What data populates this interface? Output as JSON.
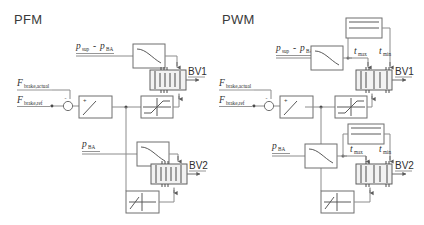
{
  "figure": {
    "background": "#ffffff",
    "wire_color": "#8c8c8c",
    "block_color": "#6f6f6f",
    "text_color": "#2f2f2f"
  },
  "panels": [
    {
      "id": "pfm",
      "title": "PFM",
      "signals": {
        "pressure_diff_first": "p",
        "pressure_diff_first_sub": "sup",
        "pressure_diff_op": "-",
        "pressure_diff_second": "p",
        "pressure_diff_second_sub": "BA",
        "force_actual": "F",
        "force_actual_sub": "brake,actual",
        "force_ref": "F",
        "force_ref_sub": "brake,ref",
        "p_ba": "p",
        "p_ba_sub": "BA"
      },
      "sum_signs": {
        "plus": "+",
        "minus": "-"
      },
      "valves": [
        {
          "name": "BV1"
        },
        {
          "name": "BV2"
        }
      ],
      "blocks": [
        {
          "name": "decay-block-top",
          "glyph": "decay"
        },
        {
          "name": "relay-block",
          "glyph": "relay"
        },
        {
          "name": "saturation-block-upper",
          "glyph": "saturation"
        },
        {
          "name": "decay-block-lower",
          "glyph": "decay"
        },
        {
          "name": "deadzone-block",
          "glyph": "deadzone"
        }
      ]
    },
    {
      "id": "pwm",
      "title": "PWM",
      "signals": {
        "pressure_diff_first": "p",
        "pressure_diff_first_sub": "sup",
        "pressure_diff_op": "-",
        "pressure_diff_second": "p",
        "pressure_diff_second_sub": "BA",
        "force_actual": "F",
        "force_actual_sub": "brake,actual",
        "force_ref": "F",
        "force_ref_sub": "brake,ref",
        "p_ba": "p",
        "p_ba_sub": "BA",
        "t_max": "t",
        "t_max_sub": "max",
        "t_min": "t",
        "t_min_sub": "min"
      },
      "sum_signs": {
        "plus": "+",
        "minus": "-"
      },
      "valves": [
        {
          "name": "BV1"
        },
        {
          "name": "BV2"
        }
      ],
      "blocks": [
        {
          "name": "decay-block-top",
          "glyph": "decay"
        },
        {
          "name": "timing-block-upper",
          "glyph": "timing"
        },
        {
          "name": "relay-block",
          "glyph": "relay"
        },
        {
          "name": "saturation-block-upper",
          "glyph": "saturation"
        },
        {
          "name": "decay-block-lower",
          "glyph": "decay"
        },
        {
          "name": "timing-block-lower",
          "glyph": "timing"
        },
        {
          "name": "deadzone-block",
          "glyph": "deadzone"
        }
      ]
    }
  ]
}
